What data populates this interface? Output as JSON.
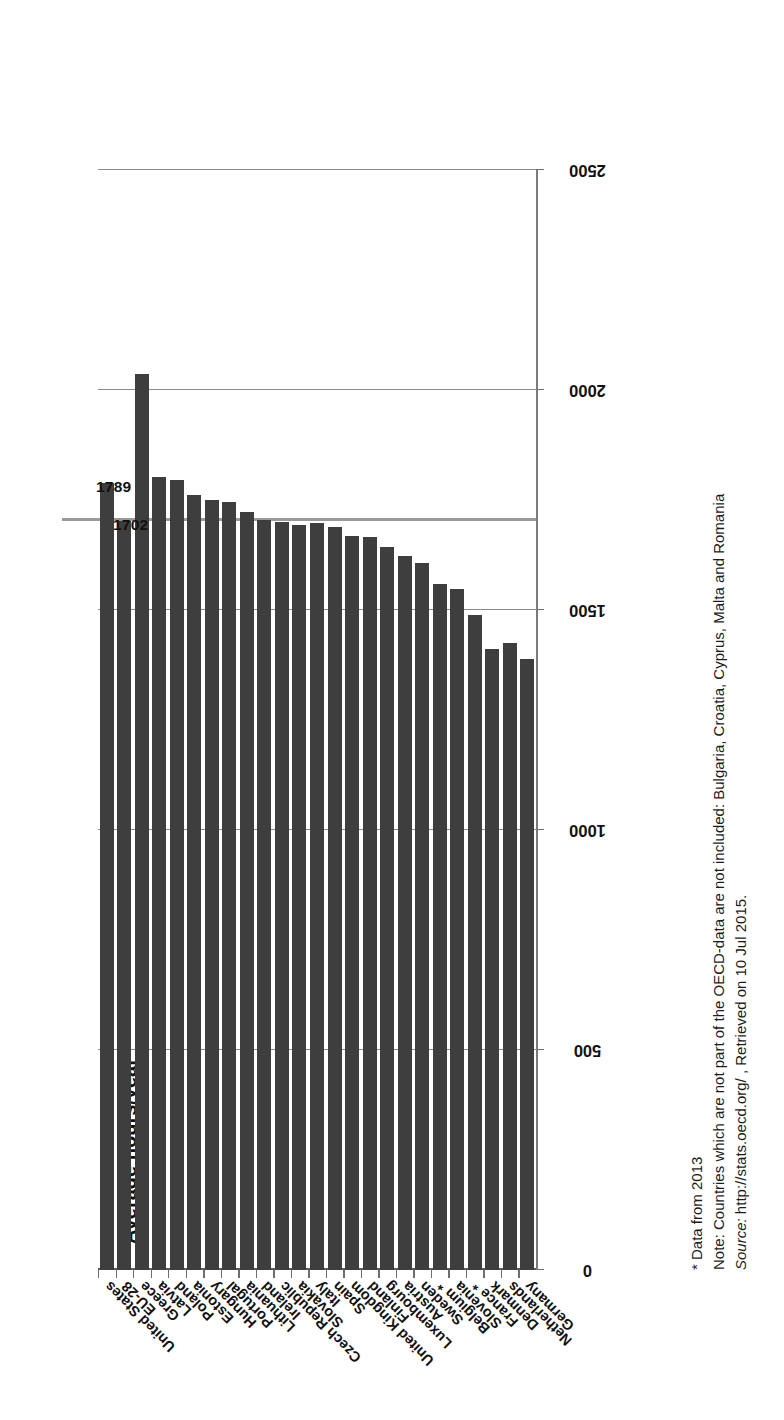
{
  "chart_data": {
    "type": "bar",
    "orientation": "horizontal-rotated",
    "title": "Average hours/year",
    "xlabel": "",
    "ylabel": "",
    "ylim": [
      0,
      2500
    ],
    "ticks": [
      0,
      500,
      1000,
      1500,
      2000,
      2500
    ],
    "tick_labels": [
      "0",
      "500",
      "1000",
      "1500",
      "2000",
      "2500"
    ],
    "grid": true,
    "legend": "none",
    "reference_line": {
      "value": 1702,
      "label": "1702",
      "color": "#9a9a9a"
    },
    "categories": [
      "Germany",
      "Netherlands",
      "Denmark",
      "France *",
      "Slovenia",
      "Belgium *",
      "Sweden",
      "Austria",
      "Luxembourg",
      "Finland",
      "United Kingdom",
      "Spain",
      "Italy",
      "Slovakia",
      "Czech Republic",
      "Ireland",
      "Lithuania",
      "Portugal",
      "Hungary",
      "Estonia",
      "Poland",
      "Latvia",
      "Greece",
      "EU-28",
      "United States"
    ],
    "values": [
      1388,
      1425,
      1411,
      1489,
      1547,
      1558,
      1607,
      1623,
      1643,
      1666,
      1669,
      1689,
      1698,
      1694,
      1700,
      1705,
      1723,
      1745,
      1749,
      1762,
      1796,
      1802,
      2037,
      1702,
      1789
    ],
    "data_labels": {
      "EU-28": "1702",
      "United States": "1789"
    },
    "bar_color": "#3e3e3e"
  },
  "notes": {
    "line1": "* Data from 2013",
    "line2": "Note: Countries which are not part of the OECD-data are not included: Bulgaria, Croatia, Cyprus, Malta and Romania",
    "line3_italic": "Source:",
    "line3_rest": " http://stats.oecd.org/ , Retrieved on 10 Jul 2015."
  }
}
